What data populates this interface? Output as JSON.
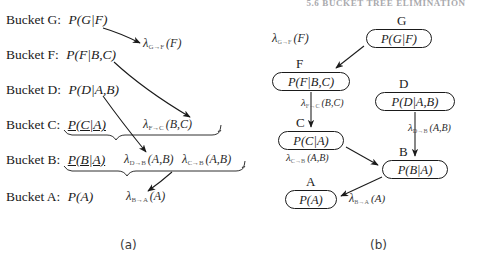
{
  "page": {
    "running_header": "5.6  BUCKET TREE ELIMINATION",
    "width": 487,
    "height": 263,
    "background": "#ffffff",
    "ink": "#1a1a1a"
  },
  "captions": {
    "left": "(a)",
    "right": "(b)"
  },
  "panel_a": {
    "name": "bucket-elimination-list",
    "rows": [
      {
        "bucket": "Bucket G:",
        "func": "P(G|F)",
        "messages": []
      },
      {
        "bucket": "Bucket F:",
        "func": "P(F|B,C)",
        "messages": [
          {
            "lambda": "λ",
            "sub": "G→F",
            "args": "(F)"
          }
        ]
      },
      {
        "bucket": "Bucket D:",
        "func": "P(D|A,B)",
        "messages": []
      },
      {
        "bucket": "Bucket C:",
        "func": "P(C|A)",
        "messages": [
          {
            "lambda": "λ",
            "sub": "F→C",
            "args": "(B,C)"
          }
        ]
      },
      {
        "bucket": "Bucket B:",
        "func": "P(B|A)",
        "messages": [
          {
            "lambda": "λ",
            "sub": "D→B",
            "args": "(A,B)"
          },
          {
            "lambda": "λ",
            "sub": "C→B",
            "args": "(A,B)"
          }
        ]
      },
      {
        "bucket": "Bucket A:",
        "func": "P(A)",
        "messages": [
          {
            "lambda": "λ",
            "sub": "B→A",
            "args": "(A)"
          }
        ]
      }
    ],
    "arrows": [
      {
        "from": "Bucket G",
        "to": "Bucket F",
        "label": "λ_{G→F}(F)"
      },
      {
        "from": "Bucket F",
        "to": "Bucket C",
        "label": "λ_{F→C}(B,C)"
      },
      {
        "from": "Bucket D",
        "to": "Bucket B",
        "label": "λ_{D→B}(A,B)"
      },
      {
        "from": "Bucket C",
        "to": "Bucket B",
        "label": "λ_{C→B}(A,B)"
      },
      {
        "from": "Bucket B",
        "to": "Bucket A",
        "label": "λ_{B→A}(A)"
      }
    ]
  },
  "panel_b": {
    "name": "bucket-tree-graph",
    "nodes": [
      {
        "id": "G",
        "label": "G",
        "content": "P(G|F)"
      },
      {
        "id": "F",
        "label": "F",
        "content": "P(F|B,C)"
      },
      {
        "id": "D",
        "label": "D",
        "content": "P(D|A,B)"
      },
      {
        "id": "C",
        "label": "C",
        "content": "P(C|A)"
      },
      {
        "id": "B",
        "label": "B",
        "content": "P(B|A)"
      },
      {
        "id": "A",
        "label": "A",
        "content": "P(A)"
      }
    ],
    "edges": [
      {
        "from": "G",
        "to": "F",
        "lambda": "λ",
        "sub": "G→F",
        "args": "(F)"
      },
      {
        "from": "F",
        "to": "C",
        "lambda": "λ",
        "sub": "F→C",
        "args": "(B,C)"
      },
      {
        "from": "D",
        "to": "B",
        "lambda": "λ",
        "sub": "D→B",
        "args": "(A,B)"
      },
      {
        "from": "C",
        "to": "B",
        "lambda": "λ",
        "sub": "C→B",
        "args": "(A,B)"
      },
      {
        "from": "B",
        "to": "A",
        "lambda": "λ",
        "sub": "B→A",
        "args": "(A)"
      }
    ]
  }
}
